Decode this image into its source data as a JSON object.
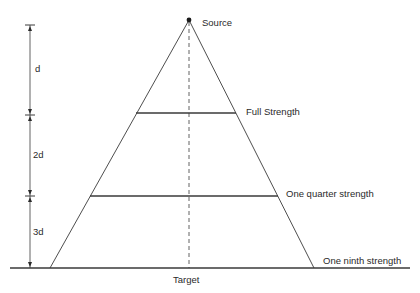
{
  "diagram": {
    "labels": {
      "source": "Source",
      "full_strength": "Full Strength",
      "quarter_strength": "One quarter strength",
      "ninth_strength": "One ninth strength",
      "target": "Target"
    },
    "dimensions": {
      "first": "d",
      "second": "2d",
      "third": "3d"
    },
    "colors": {
      "line": "#3a3a3a",
      "text": "#2a2a2a",
      "background": "#ffffff"
    }
  }
}
